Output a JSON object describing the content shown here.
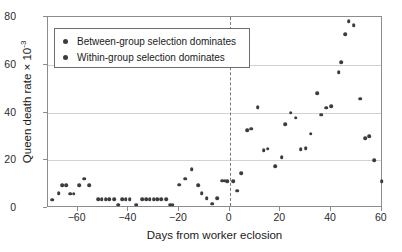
{
  "chart_data": {
    "type": "scatter",
    "title": "",
    "xlabel": "Days from worker eclosion",
    "ylabel": "Queen death rate × 10",
    "ylabel_exponent": "-3",
    "xlim": [
      -71.7,
      60.5
    ],
    "ylim": [
      0,
      80
    ],
    "xticks": [
      -60,
      -40,
      -20,
      0,
      20,
      40,
      60
    ],
    "xtick_labels": [
      "−60",
      "−40",
      "−20",
      "0",
      "20",
      "40",
      "60"
    ],
    "yticks": [
      0,
      20,
      40,
      60,
      80
    ],
    "ytick_labels": [
      "0",
      "20",
      "40",
      "60",
      "80"
    ],
    "grid": "horizontal",
    "gridlines_y": [
      0,
      20,
      40,
      60,
      80
    ],
    "annotations": [
      {
        "type": "vertical-dashed-line",
        "x": 0,
        "label": "worker eclosion"
      }
    ],
    "legend": {
      "position": "upper-left-inside",
      "entries": [
        {
          "label": "Between-group selection dominates",
          "marker": "circle",
          "color": "#3c3c3c"
        },
        {
          "label": "Within-group selection dominates",
          "marker": "circle",
          "color": "#3c3c3c"
        }
      ]
    },
    "marker_color": "#3c3c3c",
    "series": [
      {
        "name": "Queen death rate",
        "points": [
          [
            -70.0,
            3.5
          ],
          [
            -67.5,
            6.2
          ],
          [
            -66.0,
            9.6
          ],
          [
            -64.5,
            9.6
          ],
          [
            -63.0,
            6.0
          ],
          [
            -61.5,
            6.0
          ],
          [
            -59.5,
            9.5
          ],
          [
            -57.5,
            12.3
          ],
          [
            -55.5,
            9.5
          ],
          [
            -52.0,
            3.6
          ],
          [
            -50.5,
            3.6
          ],
          [
            -49.0,
            3.6
          ],
          [
            -47.5,
            3.6
          ],
          [
            -45.5,
            3.6
          ],
          [
            -44.0,
            1.4
          ],
          [
            -42.5,
            3.6
          ],
          [
            -41.0,
            3.6
          ],
          [
            -39.5,
            3.6
          ],
          [
            -37.0,
            1.4
          ],
          [
            -34.5,
            3.6
          ],
          [
            -33.0,
            3.6
          ],
          [
            -31.5,
            3.6
          ],
          [
            -30.0,
            3.6
          ],
          [
            -28.5,
            3.6
          ],
          [
            -27.0,
            3.6
          ],
          [
            -25.0,
            3.6
          ],
          [
            -23.5,
            1.4
          ],
          [
            -22.5,
            1.4
          ],
          [
            -20.0,
            9.7
          ],
          [
            -17.5,
            12.3
          ],
          [
            -15.0,
            16.3
          ],
          [
            -12.5,
            9.6
          ],
          [
            -11.0,
            6.3
          ],
          [
            -9.0,
            4.0
          ],
          [
            -7.0,
            1.8
          ],
          [
            -5.0,
            4.0
          ],
          [
            -3.0,
            11.5
          ],
          [
            -2.0,
            11.5
          ],
          [
            -1.0,
            11.3
          ],
          [
            1.5,
            11.3
          ],
          [
            3.0,
            7.3
          ],
          [
            4.5,
            14.5
          ],
          [
            7.0,
            32.5
          ],
          [
            8.5,
            33.2
          ],
          [
            11.0,
            42.2
          ],
          [
            13.5,
            24.3
          ],
          [
            15.0,
            24.8
          ],
          [
            18.0,
            17.6
          ],
          [
            20.5,
            21.3
          ],
          [
            22.0,
            35.0
          ],
          [
            24.0,
            40.0
          ],
          [
            26.0,
            37.8
          ],
          [
            28.0,
            24.7
          ],
          [
            30.0,
            25.0
          ],
          [
            32.0,
            31.2
          ],
          [
            34.5,
            48.0
          ],
          [
            36.0,
            39.0
          ],
          [
            38.0,
            42.0
          ],
          [
            40.0,
            42.7
          ],
          [
            43.0,
            57.0
          ],
          [
            44.0,
            61.0
          ],
          [
            45.5,
            72.8
          ],
          [
            47.0,
            78.2
          ],
          [
            49.0,
            76.5
          ],
          [
            51.5,
            45.8
          ],
          [
            53.5,
            29.2
          ],
          [
            55.0,
            30.0
          ],
          [
            57.0,
            20.1
          ],
          [
            60.0,
            11.2
          ]
        ]
      }
    ]
  }
}
